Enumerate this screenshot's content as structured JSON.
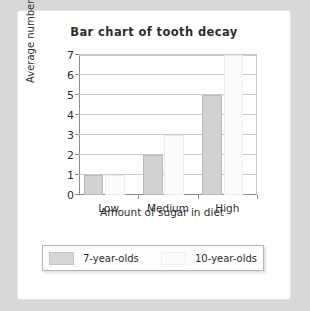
{
  "card": {
    "legend_box": {
      "entries": [
        {
          "label": "7-year-olds",
          "swatch": "gray-swatch-icon",
          "color": "#d6d6d6"
        },
        {
          "label": "10-year-olds",
          "swatch": "white-swatch-icon",
          "color": "#fcfcfc"
        }
      ]
    }
  },
  "chart_data": {
    "type": "bar",
    "title": "Bar chart of tooth decay",
    "xlabel": "Amount of sugar in diet",
    "ylabel": "Average number of fillings",
    "categories": [
      "Low",
      "Medium",
      "High"
    ],
    "series": [
      {
        "name": "7-year-olds",
        "values": [
          1,
          2,
          5
        ],
        "color": "#d2d2d2"
      },
      {
        "name": "10-year-olds",
        "values": [
          1,
          3,
          7
        ],
        "color": "#fcfcfc"
      }
    ],
    "ylim": [
      0,
      7
    ],
    "yticks": [
      0,
      1,
      2,
      3,
      4,
      5,
      6,
      7
    ],
    "ytick_labels": [
      "0",
      "1",
      "2",
      "3",
      "4",
      "5",
      "6",
      "7"
    ],
    "grid": true,
    "legend_position": "bottom"
  }
}
